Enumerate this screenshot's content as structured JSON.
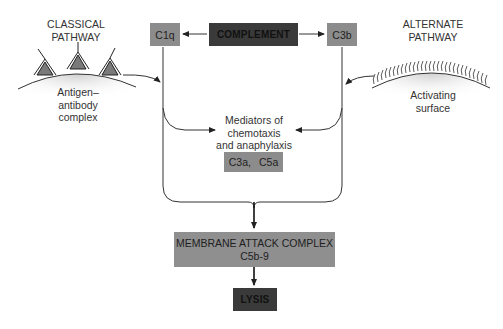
{
  "diagram": {
    "title_box": "COMPLEMENT",
    "classical": {
      "heading_line1": "CLASSICAL",
      "heading_line2": "PATHWAY",
      "surface_line1": "Antigen–",
      "surface_line2": "antibody",
      "surface_line3": "complex",
      "component": "C1q"
    },
    "alternate": {
      "heading_line1": "ALTERNATE",
      "heading_line2": "PATHWAY",
      "surface_line1": "Activating",
      "surface_line2": "surface",
      "component": "C3b"
    },
    "mediators": {
      "line1": "Mediators of",
      "line2": "chemotaxis",
      "line3": "and anaphylaxis",
      "box_item1": "C3a,",
      "box_item2": "C5a"
    },
    "mac": {
      "line1": "MEMBRANE ATTACK COMPLEX",
      "line2": "C5b-9"
    },
    "outcome": "LYSIS"
  },
  "colors": {
    "dark_box": "#3a3a3a",
    "mid_box": "#8c8c8c",
    "line": "#333333",
    "antibody_fill": "#7a7a7a"
  }
}
